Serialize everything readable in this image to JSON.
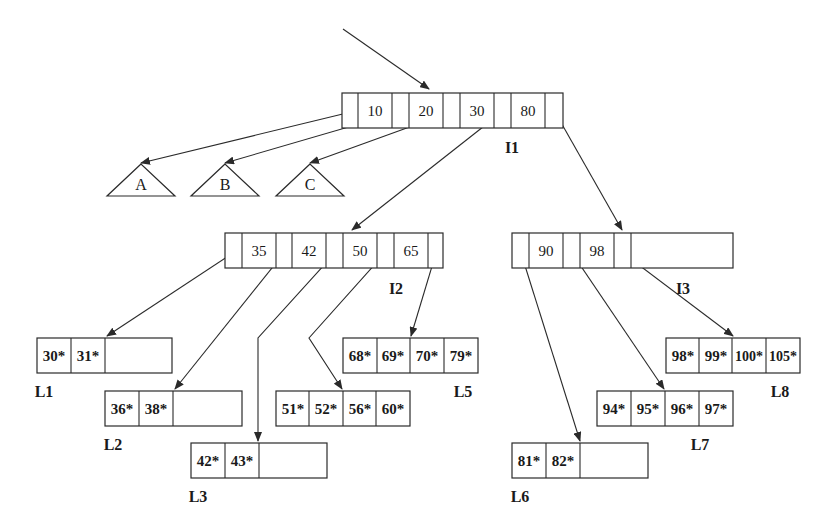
{
  "diagram": {
    "type": "B+ tree",
    "root_pointer": true,
    "colors": {
      "stroke": "#2a2a2a",
      "text": "#1a1a1a",
      "background": "#ffffff"
    },
    "internal_nodes": [
      {
        "id": "I1",
        "label": "I1",
        "keys": [
          "10",
          "20",
          "30",
          "80"
        ]
      },
      {
        "id": "I2",
        "label": "I2",
        "keys": [
          "35",
          "42",
          "50",
          "65"
        ]
      },
      {
        "id": "I3",
        "label": "I3",
        "keys": [
          "90",
          "98"
        ]
      }
    ],
    "subtrees": [
      {
        "id": "A",
        "label": "A"
      },
      {
        "id": "B",
        "label": "B"
      },
      {
        "id": "C",
        "label": "C"
      }
    ],
    "leaves": [
      {
        "id": "L1",
        "label": "L1",
        "entries": [
          "30*",
          "31*",
          "",
          ""
        ]
      },
      {
        "id": "L2",
        "label": "L2",
        "entries": [
          "36*",
          "38*",
          "",
          ""
        ]
      },
      {
        "id": "L3",
        "label": "L3",
        "entries": [
          "42*",
          "43*",
          "",
          ""
        ]
      },
      {
        "id": "L4",
        "label": "L4",
        "entries": [
          "51*",
          "52*",
          "56*",
          "60*"
        ]
      },
      {
        "id": "L5",
        "label": "L5",
        "entries": [
          "68*",
          "69*",
          "70*",
          "79*"
        ]
      },
      {
        "id": "L6",
        "label": "L6",
        "entries": [
          "81*",
          "82*",
          "",
          ""
        ]
      },
      {
        "id": "L7",
        "label": "L7",
        "entries": [
          "94*",
          "95*",
          "96*",
          "97*"
        ]
      },
      {
        "id": "L8",
        "label": "L8",
        "entries": [
          "98*",
          "99*",
          "100*",
          "105*"
        ]
      }
    ],
    "edges": [
      {
        "from": "root",
        "to": "I1"
      },
      {
        "from": "I1.p0",
        "to": "A"
      },
      {
        "from": "I1.p1",
        "to": "B"
      },
      {
        "from": "I1.p2",
        "to": "C"
      },
      {
        "from": "I1.p3",
        "to": "I2"
      },
      {
        "from": "I1.p4",
        "to": "I3"
      },
      {
        "from": "I2.p0",
        "to": "L1"
      },
      {
        "from": "I2.p1",
        "to": "L2"
      },
      {
        "from": "I2.p2",
        "to": "L3"
      },
      {
        "from": "I2.p3",
        "to": "L4"
      },
      {
        "from": "I2.p4",
        "to": "L5"
      },
      {
        "from": "I3.p0",
        "to": "L6"
      },
      {
        "from": "I3.p1",
        "to": "L7"
      },
      {
        "from": "I3.p2",
        "to": "L8"
      }
    ]
  }
}
